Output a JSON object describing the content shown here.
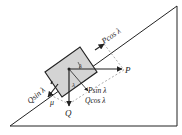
{
  "diagram": {
    "colors": {
      "line": "#222222",
      "block_fill": "#d4d4d4",
      "dashed": "#888888"
    },
    "labels": {
      "p": "P",
      "p_cos": "Pcos λ",
      "p_sin": "Psin λ",
      "q": "Q",
      "q_sin": "Qsin λ",
      "q_cos": "Qcos λ",
      "mu": "μ",
      "lambda_top": "λ",
      "lambda_mid": "λ"
    }
  }
}
